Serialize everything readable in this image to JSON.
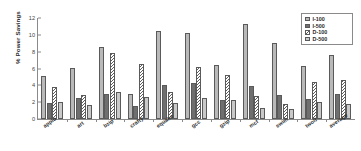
{
  "chart_data": {
    "type": "bar",
    "title": "",
    "xlabel": "",
    "ylabel": "% Power Savings",
    "ylim": [
      0,
      12
    ],
    "yticks": [
      "0",
      "2",
      "4",
      "6",
      "8",
      "10",
      "12"
    ],
    "grid": false,
    "legend_position": "top-right",
    "categories": [
      "applu",
      "art",
      "bzip",
      "crafty",
      "equake",
      "gcc",
      "gzip",
      "mcf",
      "swim",
      "twolf",
      "average"
    ],
    "series": [
      {
        "name": "I-100",
        "values": [
          5.1,
          6.1,
          8.5,
          3.0,
          10.4,
          10.2,
          6.4,
          11.3,
          9.0,
          6.3,
          7.6
        ]
      },
      {
        "name": "I-500",
        "values": [
          1.9,
          2.5,
          3.0,
          1.6,
          4.1,
          4.3,
          2.3,
          3.9,
          2.8,
          2.4,
          3.0
        ]
      },
      {
        "name": "D-100",
        "values": [
          3.8,
          2.9,
          7.8,
          6.5,
          3.2,
          6.2,
          5.2,
          2.7,
          1.8,
          4.4,
          4.6
        ]
      },
      {
        "name": "D-500",
        "values": [
          2.0,
          1.7,
          3.2,
          2.6,
          1.9,
          2.5,
          2.2,
          1.3,
          1.2,
          2.0,
          1.8
        ]
      }
    ]
  },
  "legend": {
    "items": [
      {
        "label": "I-100"
      },
      {
        "label": "I-500"
      },
      {
        "label": "D-100"
      },
      {
        "label": "D-500"
      }
    ]
  },
  "colors": {
    "series_1": "#b9b9b9",
    "series_2": "#6f6f6f",
    "series_3": "#ffffff",
    "series_4": "#c9c9c9",
    "axis": "#8a8a8a",
    "text": "#2b2b2b"
  }
}
